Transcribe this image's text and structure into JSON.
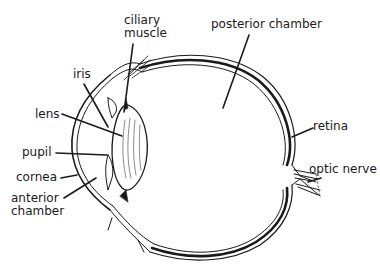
{
  "diagram": {
    "labels": {
      "ciliary_muscle_line1": "ciliary",
      "ciliary_muscle_line2": "muscle",
      "posterior_chamber": "posterior chamber",
      "iris": "iris",
      "lens": "lens",
      "pupil": "pupil",
      "cornea": "cornea",
      "anterior_chamber_line1": "anterior",
      "anterior_chamber_line2": "chamber",
      "retina": "retina",
      "optic_nerve": "optic nerve"
    },
    "colors": {
      "ink": "#1a1a1a",
      "background": "#ffffff"
    }
  }
}
